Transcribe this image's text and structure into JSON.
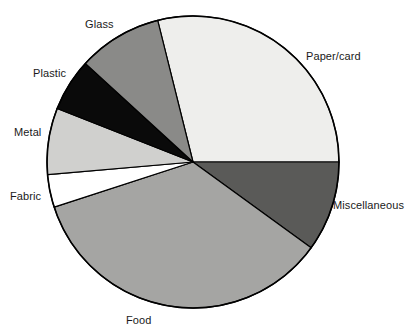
{
  "chart_data": {
    "type": "pie",
    "title": "",
    "subtitle": "",
    "xlabel": "",
    "ylabel": "",
    "legend_position": "none",
    "labels_position": "outside-callout",
    "grid": false,
    "center": {
      "x": 193,
      "y": 162
    },
    "radius": 146,
    "start_angle_deg": -14,
    "direction": "clockwise",
    "categories": [
      "Paper/card",
      "Miscellaneous",
      "Food",
      "Fabric",
      "Metal",
      "Plastic",
      "Glass"
    ],
    "values": [
      28.9,
      10.0,
      35.0,
      3.6,
      7.4,
      5.8,
      9.3
    ],
    "angles_deg": [
      104,
      36,
      126,
      13,
      26.5,
      21,
      33.5
    ],
    "slices": [
      {
        "label": "Paper/card",
        "value": 28.9,
        "angle_deg": 104,
        "start_deg": -14,
        "end_deg": 90,
        "color": "#eeeeec"
      },
      {
        "label": "Miscellaneous",
        "value": 10.0,
        "angle_deg": 36,
        "start_deg": 90,
        "end_deg": 126,
        "color": "#5a5a58"
      },
      {
        "label": "Food",
        "value": 35.0,
        "angle_deg": 126,
        "start_deg": 126,
        "end_deg": 252,
        "color": "#a5a5a3"
      },
      {
        "label": "Fabric",
        "value": 3.6,
        "angle_deg": 13,
        "start_deg": 252,
        "end_deg": 265,
        "color": "#ffffff"
      },
      {
        "label": "Metal",
        "value": 7.4,
        "angle_deg": 26.5,
        "start_deg": 265,
        "end_deg": 291.5,
        "color": "#d0d0ce"
      },
      {
        "label": "Plastic",
        "value": 5.8,
        "angle_deg": 21,
        "start_deg": 291.5,
        "end_deg": 312.5,
        "color": "#0a0a0a"
      },
      {
        "label": "Glass",
        "value": 9.3,
        "angle_deg": 33.5,
        "start_deg": 312.5,
        "end_deg": 346,
        "color": "#8a8a88"
      }
    ],
    "outline_color": "#000000"
  },
  "labels": {
    "glass": "Glass",
    "paper_card": "Paper/card",
    "plastic": "Plastic",
    "metal": "Metal",
    "fabric": "Fabric",
    "miscellaneous": "Miscellaneous",
    "food": "Food"
  }
}
